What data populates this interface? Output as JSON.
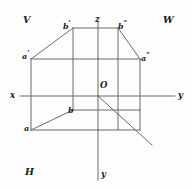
{
  "figure": {
    "type": "descriptive-geometry-axonometric-projection",
    "background_color": "#fdfdfd",
    "line_color": "#6b6b6b",
    "label_color": "#1b1b1b"
  },
  "plane_labels": {
    "vertical": "V",
    "profile": "W",
    "horizontal": "H"
  },
  "axis_labels": {
    "x": "x",
    "y_right": "y",
    "z": "z",
    "y_down": "y"
  },
  "origin_label": "O",
  "point_labels": {
    "a": "a",
    "a_prime": "a'",
    "a_double_prime": "a\"",
    "b": "b",
    "b_prime": "b'",
    "b_double_prime": "b\""
  },
  "point_label_parts": {
    "a": {
      "base": "a",
      "mark": ""
    },
    "a_prime": {
      "base": "a",
      "mark": "'"
    },
    "a_double_prime": {
      "base": "a",
      "mark": "\""
    },
    "b": {
      "base": "b",
      "mark": ""
    },
    "b_prime": {
      "base": "b",
      "mark": "'"
    },
    "b_double_prime": {
      "base": "b",
      "mark": "\""
    }
  },
  "geometry": {
    "origin": {
      "x": 98,
      "y": 96
    },
    "outer_box": {
      "left": 31,
      "right": 140,
      "top": 59,
      "bottom": 130
    },
    "top_ridge": {
      "left": 73,
      "right": 118,
      "y": 28
    },
    "axis_x_end": {
      "x": 20,
      "y": 96
    },
    "axis_y_right_end": {
      "x": 175,
      "y": 96
    },
    "axis_z_end": {
      "x": 98,
      "y": 22
    },
    "axis_y_down_end": {
      "x": 98,
      "y": 180
    },
    "diagonal_end": {
      "x": 152,
      "y": 145
    }
  }
}
